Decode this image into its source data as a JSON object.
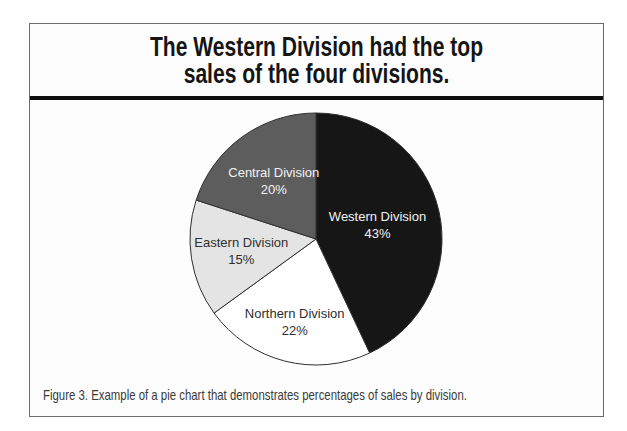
{
  "figure": {
    "title_line1": "The Western Division had the top",
    "title_line2": "sales of the four divisions.",
    "caption": "Figure 3. Example of a pie chart that demonstrates percentages of sales by division."
  },
  "colors": {
    "title_divider": "#0e0e0e",
    "figure_border": "#6b6b6b",
    "slice_outline": "#2f2f2f",
    "label_light": "#f2f2f2",
    "label_dark": "#2e2e2e"
  },
  "chart_data": {
    "type": "pie",
    "title": "The Western Division had the top sales of the four divisions.",
    "start_angle_deg": 0,
    "direction": "clockwise",
    "legend_position": "none",
    "labels_inside_slices": true,
    "slices": [
      {
        "label": "Western Division",
        "value_pct": 43,
        "color": "#161616",
        "text_color": "#f2f2f2",
        "label_r": 0.5
      },
      {
        "label": "Northern Division",
        "value_pct": 22,
        "color": "#ffffff",
        "text_color": "#2e2e2e",
        "label_r": 0.68
      },
      {
        "label": "Eastern Division",
        "value_pct": 15,
        "color": "#e4e4e4",
        "text_color": "#2e2e2e",
        "label_r": 0.6
      },
      {
        "label": "Central Division",
        "value_pct": 20,
        "color": "#5d5d5d",
        "text_color": "#f2f2f2",
        "label_r": 0.57
      }
    ]
  }
}
